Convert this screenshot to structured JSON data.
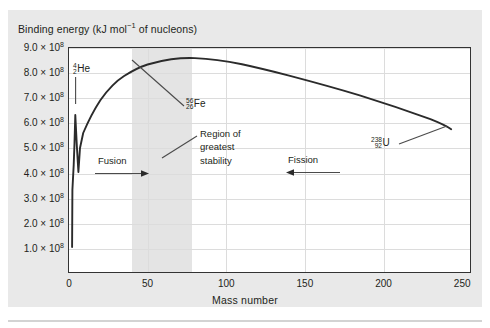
{
  "figure": {
    "y_axis_caption": "Binding energy (kJ mol",
    "y_axis_caption_sup": "−1",
    "y_axis_caption_tail": " of nucleons)",
    "x_axis_caption": "Mass number"
  },
  "chart_data": {
    "type": "line",
    "title": "Binding energy (kJ mol−1 of nucleons)",
    "xlabel": "Mass number",
    "ylabel": "Binding energy (kJ mol−1 of nucleons)",
    "xlim": [
      0,
      255
    ],
    "ylim": [
      0,
      950000000
    ],
    "grid": true,
    "legend": "none",
    "x_ticks": [
      "0",
      "50",
      "100",
      "150",
      "200",
      "250"
    ],
    "x_tick_values": [
      0,
      50,
      100,
      150,
      200,
      250
    ],
    "y_ticks": [
      "1.0",
      "2.0",
      "3.0",
      "4.0",
      "5.0",
      "6.0",
      "7.0",
      "8.0",
      "9.0"
    ],
    "y_tick_suffix": "× 10",
    "y_tick_exponent": "8",
    "y_tick_values": [
      100000000,
      200000000,
      300000000,
      400000000,
      500000000,
      600000000,
      700000000,
      800000000,
      900000000
    ],
    "series": [
      {
        "name": "Binding energy per nucleon",
        "x": [
          2,
          2,
          3,
          4,
          5,
          6,
          7,
          9,
          11,
          13,
          16,
          20,
          24,
          28,
          32,
          36,
          40,
          45,
          50,
          56,
          62,
          70,
          80,
          90,
          100,
          115,
          130,
          150,
          170,
          190,
          210,
          230,
          243
        ],
        "y": [
          100000000,
          330000000,
          570000000,
          790000000,
          640000000,
          500000000,
          525000000,
          600000000,
          665000000,
          705000000,
          750000000,
          790000000,
          815000000,
          835000000,
          850000000,
          862000000,
          870000000,
          878000000,
          883000000,
          885000000,
          884000000,
          881000000,
          876000000,
          871000000,
          866000000,
          858000000,
          850000000,
          838000000,
          825000000,
          812000000,
          798000000,
          782000000,
          762000000
        ]
      }
    ],
    "shaded_region": {
      "label": "Region of greatest stability",
      "x_start": 40,
      "x_end": 78,
      "color": "#e4e4e4"
    },
    "annotations": [
      {
        "name": "helium-4",
        "mass_superscript": "4",
        "charge_subscript": "2",
        "symbol": "He",
        "x": 4,
        "y": 790000000
      },
      {
        "name": "iron-56",
        "mass_superscript": "56",
        "charge_subscript": "26",
        "symbol": "Fe",
        "x": 56,
        "y": 885000000
      },
      {
        "name": "uranium-238",
        "mass_superscript": "238",
        "charge_subscript": "92",
        "symbol": "U",
        "x": 238,
        "y": 765000000
      }
    ],
    "direction_markers": [
      {
        "label": "Fusion",
        "direction": "right"
      },
      {
        "label": "Fission",
        "direction": "left"
      }
    ],
    "region_note_lines": [
      "Region of",
      "greatest",
      "stability"
    ]
  },
  "labels": {
    "fusion": "Fusion",
    "fission": "Fission",
    "region_line_1": "Region of",
    "region_line_2": "greatest",
    "region_line_3": "stability"
  },
  "colors": {
    "panel_bg": "#e9e9e9",
    "plot_bg": "#ffffff",
    "frame": "#333333",
    "grid": "#dcdcdc",
    "curve": "#2b2b2b",
    "band": "#e4e4e4",
    "text": "#231f20"
  }
}
